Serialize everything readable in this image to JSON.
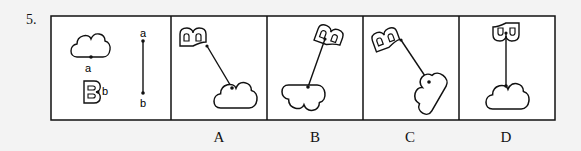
{
  "question": {
    "number": "5.",
    "stem": {
      "cloud_point_label": "a",
      "b_shape_point_label": "b",
      "stick_top_label": "a",
      "stick_bottom_label": "b"
    },
    "options": [
      {
        "label": "A"
      },
      {
        "label": "B"
      },
      {
        "label": "C"
      },
      {
        "label": "D"
      }
    ]
  },
  "colors": {
    "background": "#f3f3f3",
    "line": "#111111",
    "box_fill": "#ffffff"
  }
}
